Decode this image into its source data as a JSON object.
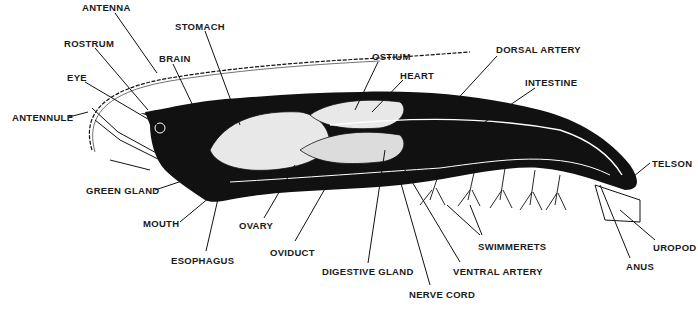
{
  "diagram": {
    "colors": {
      "ink": "#111111",
      "paper": "#ffffff",
      "organ_fill": "#e8e8e8"
    },
    "labels": [
      {
        "id": "antenna",
        "text": "ANTENNA",
        "x": 82,
        "y": 3
      },
      {
        "id": "rostrum",
        "text": "ROSTRUM",
        "x": 64,
        "y": 39
      },
      {
        "id": "stomach",
        "text": "STOMACH",
        "x": 175,
        "y": 22
      },
      {
        "id": "brain",
        "text": "BRAIN",
        "x": 159,
        "y": 54
      },
      {
        "id": "eye",
        "text": "EYE",
        "x": 67,
        "y": 73
      },
      {
        "id": "antennule",
        "text": "ANTENNULE",
        "x": 12,
        "y": 113
      },
      {
        "id": "ostium",
        "text": "OSTIUM",
        "x": 372,
        "y": 52
      },
      {
        "id": "heart",
        "text": "HEART",
        "x": 400,
        "y": 71
      },
      {
        "id": "dorsal-artery",
        "text": "DORSAL ARTERY",
        "x": 496,
        "y": 45
      },
      {
        "id": "intestine",
        "text": "INTESTINE",
        "x": 525,
        "y": 78
      },
      {
        "id": "green-gland",
        "text": "GREEN GLAND",
        "x": 86,
        "y": 186
      },
      {
        "id": "mouth",
        "text": "MOUTH",
        "x": 143,
        "y": 219
      },
      {
        "id": "ovary",
        "text": "OVARY",
        "x": 239,
        "y": 221
      },
      {
        "id": "esophagus",
        "text": "ESOPHAGUS",
        "x": 171,
        "y": 256
      },
      {
        "id": "oviduct",
        "text": "OVIDUCT",
        "x": 270,
        "y": 248
      },
      {
        "id": "digestive-gland",
        "text": "DIGESTIVE GLAND",
        "x": 322,
        "y": 267
      },
      {
        "id": "nerve-cord",
        "text": "NERVE CORD",
        "x": 409,
        "y": 290
      },
      {
        "id": "ventral-artery",
        "text": "VENTRAL ARTERY",
        "x": 453,
        "y": 267
      },
      {
        "id": "swimmerets",
        "text": "SWIMMERETS",
        "x": 478,
        "y": 242
      },
      {
        "id": "telson",
        "text": "TELSON",
        "x": 652,
        "y": 159
      },
      {
        "id": "uropod",
        "text": "UROPOD",
        "x": 653,
        "y": 243
      },
      {
        "id": "anus",
        "text": "ANUS",
        "x": 626,
        "y": 262
      }
    ]
  }
}
